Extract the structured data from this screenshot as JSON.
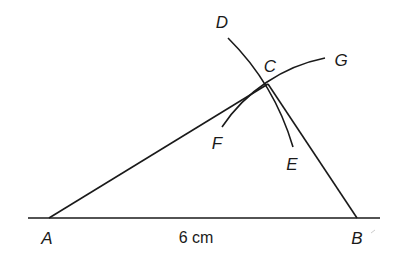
{
  "diagram": {
    "colors": {
      "stroke": "#1a1a1a",
      "background": "#ffffff"
    },
    "points": {
      "A": {
        "label": "A",
        "x": 49,
        "y": 218
      },
      "B": {
        "label": "B",
        "x": 357,
        "y": 218
      },
      "C": {
        "label": "C",
        "x": 268,
        "y": 84
      }
    },
    "arc_labels": {
      "D": "D",
      "E": "E",
      "F": "F",
      "G": "G"
    },
    "base_measure": "6 cm"
  }
}
